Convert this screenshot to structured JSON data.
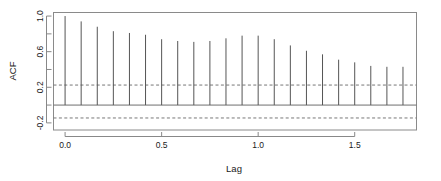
{
  "chart_data": {
    "type": "bar",
    "title": "",
    "subtitle": "",
    "xlabel": "Lag",
    "ylabel": "ACF",
    "xlim": [
      -0.06,
      1.82
    ],
    "ylim": [
      -0.28,
      1.04
    ],
    "xticks": [
      0.0,
      0.5,
      1.0,
      1.5
    ],
    "xtick_labels": [
      "0.0",
      "0.5",
      "1.0",
      "1.5"
    ],
    "yticks": [
      1.0,
      0.6,
      0.2,
      -0.2
    ],
    "ytick_labels": [
      "1.0",
      "0.6",
      "0.2",
      "-0.2"
    ],
    "yticks_minor": [
      0.8,
      0.4,
      0.0
    ],
    "grid": false,
    "legend": null,
    "series_style": "stem",
    "line_color": "#555555",
    "frame_color": "#888888",
    "zero_line": 0.0,
    "confidence_bands": {
      "upper": 0.225,
      "lower": -0.145,
      "style": "dashed",
      "color": "#777777"
    },
    "lag_step": 0.08333,
    "x": [
      0.0,
      0.0833,
      0.1667,
      0.25,
      0.3333,
      0.4167,
      0.5,
      0.5833,
      0.6667,
      0.75,
      0.8333,
      0.9167,
      1.0,
      1.0833,
      1.1667,
      1.25,
      1.3333,
      1.4167,
      1.5,
      1.5833,
      1.6667,
      1.75
    ],
    "values": [
      1.0,
      0.94,
      0.88,
      0.83,
      0.81,
      0.79,
      0.74,
      0.72,
      0.71,
      0.72,
      0.75,
      0.78,
      0.78,
      0.74,
      0.67,
      0.61,
      0.57,
      0.51,
      0.48,
      0.44,
      0.43,
      0.43
    ],
    "categories": [
      "0.0000",
      "0.0833",
      "0.1667",
      "0.2500",
      "0.3333",
      "0.4167",
      "0.5000",
      "0.5833",
      "0.6667",
      "0.7500",
      "0.8333",
      "0.9167",
      "1.0000",
      "1.0833",
      "1.1667",
      "1.2500",
      "1.3333",
      "1.4167",
      "1.5000",
      "1.5833",
      "1.6667",
      "1.7500"
    ]
  },
  "axes": {
    "y_title": "ACF",
    "x_title": "Lag"
  }
}
